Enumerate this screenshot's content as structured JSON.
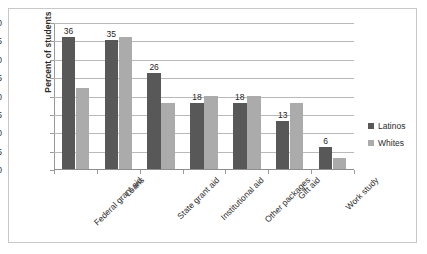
{
  "chart_data": {
    "type": "bar",
    "title": "",
    "xlabel": "",
    "ylabel": "Percent of students",
    "ylim": [
      0,
      40
    ],
    "ytick_step": 5,
    "yticks": [
      "40",
      "35",
      "30",
      "25",
      "20",
      "15",
      "10",
      "5",
      "0"
    ],
    "grid": true,
    "legend_position": "right",
    "categories": [
      "Federal grant aid",
      "Loans",
      "State grant aid",
      "Institutional aid",
      "Other packages",
      "Gift aid",
      "Work study"
    ],
    "series": [
      {
        "name": "Latinos",
        "color": "#585858",
        "values": [
          36,
          35,
          26,
          18,
          18,
          13,
          6
        ],
        "labels": [
          "36",
          "35",
          "26",
          "18",
          "18",
          "13",
          "6"
        ],
        "labels_shown": true
      },
      {
        "name": "Whites",
        "color": "#ababab",
        "values": [
          22,
          36,
          18,
          20,
          20,
          18,
          3
        ],
        "labels": [
          "22",
          "36",
          "18",
          "20",
          "20",
          "18",
          "3"
        ],
        "labels_shown": false
      }
    ]
  },
  "legend": {
    "items": [
      {
        "label": "Latinos"
      },
      {
        "label": "Whites"
      }
    ]
  }
}
